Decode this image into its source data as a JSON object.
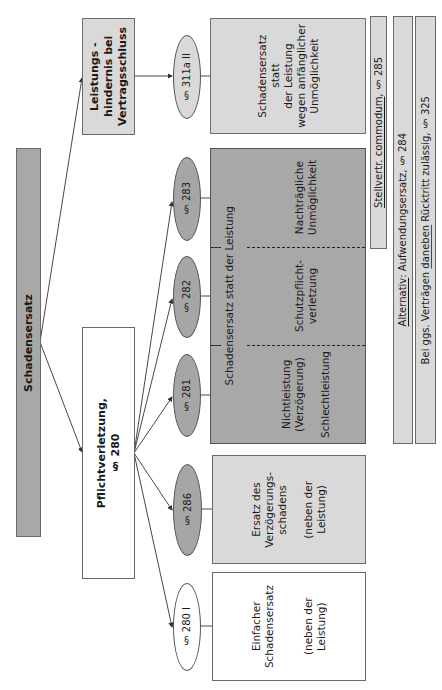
{
  "root": {
    "label": "Schadensersatz"
  },
  "branches": {
    "leistungshindernis": {
      "label": "Leistungs -\nhindernis  bei\nVertragsschluss"
    },
    "pflichtverletzung": {
      "label": "Pflichtverletzung,\n§ 280"
    }
  },
  "paragraphs": {
    "p311a": "§ 311a II",
    "p283": "§ 283",
    "p282": "§ 282",
    "p281": "§ 281",
    "p286": "§ 286",
    "p280": "§ 280 I"
  },
  "results": {
    "anfaenglich": {
      "label": "Schadensersatz\nstatt\nder Leistung\nwegen anfänglicher\nUnmöglichkeit"
    },
    "statt_der_leistung": {
      "header": "Schadensersatz statt der Leistung",
      "cells": [
        {
          "id": "nachtraeglich",
          "label": "Nachträgliche\nUnmöglichkeit"
        },
        {
          "id": "schutzpflicht",
          "label": "Schutzpflicht-\nverletzung"
        },
        {
          "id": "nichtleistung",
          "label": "Nichtleistung\n(Verzögerung)\n\nSchlechtleistung"
        }
      ]
    },
    "verzoegerung": {
      "label": "Ersatz des\nVerzögerungs-\nschadens\n\n(neben der\nLeistung)"
    },
    "einfach": {
      "label": "Einfacher\nSchadensersatz\n\n\n(neben der\nLeistung)"
    }
  },
  "side_bars": {
    "stellvertr": {
      "underlined": "Stellvertr. commodum",
      "rest": ", § 285"
    },
    "alternativ": {
      "underlined": "Alternativ",
      "rest": ": Aufwendungsersatz,  § 284"
    },
    "ggs": {
      "prefix": "Bei ggs. Verträgen  ",
      "underlined": "daneben",
      "rest": " Rücktritt zulässig,  § 325"
    }
  },
  "colors": {
    "dark_fill": "#a8a8a8",
    "light_fill": "#d9d9d9",
    "border": "#6a6a6a",
    "line": "#333333"
  }
}
